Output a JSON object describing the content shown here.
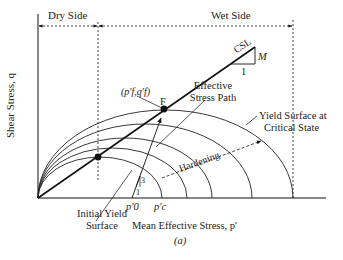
{
  "figure": {
    "caption": "(a)",
    "header": {
      "dry_side": "Dry Side",
      "wet_side": "Wet Side"
    },
    "axes": {
      "y_label": "Shear Stress, q",
      "x_label": "Mean Effective Stress, p'"
    },
    "csl": {
      "label": "CSL",
      "slope_label": "M",
      "run_label": "1"
    },
    "failure_point": {
      "coord_label": "(p'f,q'f)",
      "name": "F"
    },
    "stress_path": {
      "label_line1": "Effective",
      "label_line2": "Stress Path",
      "slope_rise": "3",
      "slope_run": "1"
    },
    "yield_surfaces": {
      "initial_label_line1": "Initial Yield",
      "initial_label_line2": "Surface",
      "critical_label_line1": "Yield Surface at",
      "critical_label_line2": "Critical State",
      "hardening_label": "Hardening"
    },
    "x_ticks": {
      "p0": "p'0",
      "pc": "p'c"
    },
    "colors": {
      "line": "#111111",
      "background": "#ffffff"
    }
  }
}
